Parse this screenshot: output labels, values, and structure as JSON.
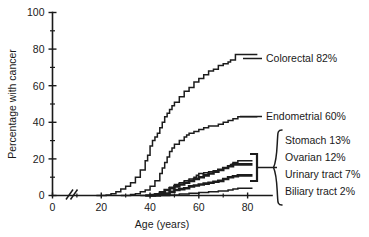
{
  "chart_data": {
    "type": "line",
    "title": "",
    "xlabel": "Age (years)",
    "ylabel": "Percentage with cancer",
    "xlim": [
      0,
      90
    ],
    "ylim": [
      0,
      100
    ],
    "x_ticks": [
      0,
      20,
      40,
      60,
      80
    ],
    "x_ticks_minor": [
      10,
      30,
      50,
      70
    ],
    "y_ticks": [
      0,
      20,
      40,
      60,
      80,
      100
    ],
    "y_ticks_minor": [
      10,
      30,
      50,
      70,
      90
    ],
    "grid": false,
    "legend_position": "right-inline-labels",
    "axis_break": {
      "axis": "x",
      "at": 10,
      "style": "double-slash"
    },
    "series": [
      {
        "name": "Colorectal",
        "label": "Colorectal 82%",
        "lifetime_risk_percent": 82,
        "emphasis": "normal",
        "points": [
          [
            18,
            0
          ],
          [
            22,
            0.3
          ],
          [
            24,
            1
          ],
          [
            26,
            2
          ],
          [
            28,
            3.5
          ],
          [
            30,
            5
          ],
          [
            32,
            7
          ],
          [
            34,
            10
          ],
          [
            36,
            14
          ],
          [
            38,
            19
          ],
          [
            39,
            22
          ],
          [
            40,
            27
          ],
          [
            41,
            30
          ],
          [
            42,
            32
          ],
          [
            43,
            34
          ],
          [
            44,
            37
          ],
          [
            45,
            40
          ],
          [
            46,
            43
          ],
          [
            47,
            45
          ],
          [
            48,
            47
          ],
          [
            49,
            49
          ],
          [
            50,
            51
          ],
          [
            52,
            54
          ],
          [
            54,
            57
          ],
          [
            56,
            59
          ],
          [
            58,
            62
          ],
          [
            60,
            64
          ],
          [
            62,
            66
          ],
          [
            64,
            68
          ],
          [
            66,
            69
          ],
          [
            68,
            71
          ],
          [
            70,
            72
          ],
          [
            72,
            73
          ],
          [
            73,
            74
          ],
          [
            74,
            74
          ],
          [
            75,
            77
          ],
          [
            78,
            77
          ],
          [
            84,
            77
          ]
        ]
      },
      {
        "name": "Endometrial",
        "label": "Endometrial 60%",
        "lifetime_risk_percent": 60,
        "emphasis": "normal",
        "points": [
          [
            28,
            0
          ],
          [
            32,
            0.5
          ],
          [
            34,
            1
          ],
          [
            36,
            2
          ],
          [
            38,
            3
          ],
          [
            40,
            5
          ],
          [
            42,
            8
          ],
          [
            44,
            12
          ],
          [
            45,
            15
          ],
          [
            46,
            18
          ],
          [
            47,
            21
          ],
          [
            48,
            24
          ],
          [
            49,
            26
          ],
          [
            50,
            28
          ],
          [
            52,
            30
          ],
          [
            54,
            32
          ],
          [
            55,
            33
          ],
          [
            56,
            34
          ],
          [
            58,
            35
          ],
          [
            60,
            36
          ],
          [
            62,
            37
          ],
          [
            64,
            38
          ],
          [
            66,
            38
          ],
          [
            68,
            39
          ],
          [
            70,
            40
          ],
          [
            72,
            41
          ],
          [
            74,
            42
          ],
          [
            76,
            43
          ],
          [
            84,
            43
          ]
        ]
      },
      {
        "name": "Stomach",
        "label": "Stomach 13%",
        "lifetime_risk_percent": 13,
        "emphasis": "normal",
        "points": [
          [
            36,
            0
          ],
          [
            40,
            0.5
          ],
          [
            42,
            1
          ],
          [
            44,
            2
          ],
          [
            46,
            3
          ],
          [
            48,
            4.5
          ],
          [
            50,
            6
          ],
          [
            52,
            7
          ],
          [
            54,
            8
          ],
          [
            56,
            9
          ],
          [
            58,
            10
          ],
          [
            59,
            11
          ],
          [
            60,
            12
          ],
          [
            62,
            12.5
          ],
          [
            64,
            13
          ],
          [
            66,
            13.5
          ],
          [
            68,
            14
          ],
          [
            70,
            15
          ],
          [
            72,
            16
          ],
          [
            73,
            17
          ],
          [
            74,
            18
          ],
          [
            76,
            19
          ],
          [
            78,
            19
          ],
          [
            82,
            19
          ]
        ]
      },
      {
        "name": "Ovarian",
        "label": "Ovarian 12%",
        "lifetime_risk_percent": 12,
        "emphasis": "thick",
        "points": [
          [
            38,
            0
          ],
          [
            42,
            0.5
          ],
          [
            44,
            1.5
          ],
          [
            46,
            3
          ],
          [
            48,
            4
          ],
          [
            50,
            5
          ],
          [
            52,
            6
          ],
          [
            54,
            7
          ],
          [
            56,
            8
          ],
          [
            58,
            9
          ],
          [
            60,
            10
          ],
          [
            62,
            11
          ],
          [
            64,
            12
          ],
          [
            66,
            13
          ],
          [
            68,
            14
          ],
          [
            70,
            15
          ],
          [
            72,
            16
          ],
          [
            74,
            17
          ],
          [
            76,
            17
          ],
          [
            82,
            17
          ]
        ]
      },
      {
        "name": "Urinary tract",
        "label": "Urinary tract 7%",
        "lifetime_risk_percent": 7,
        "emphasis": "thick",
        "points": [
          [
            40,
            0
          ],
          [
            44,
            0.5
          ],
          [
            46,
            1
          ],
          [
            48,
            2
          ],
          [
            50,
            3
          ],
          [
            52,
            3.5
          ],
          [
            54,
            4
          ],
          [
            56,
            5
          ],
          [
            58,
            5.5
          ],
          [
            60,
            6
          ],
          [
            62,
            6.5
          ],
          [
            64,
            7
          ],
          [
            66,
            7.5
          ],
          [
            68,
            8
          ],
          [
            70,
            9
          ],
          [
            72,
            10
          ],
          [
            74,
            10.5
          ],
          [
            76,
            11
          ],
          [
            82,
            11
          ]
        ]
      },
      {
        "name": "Biliary tract",
        "label": "Biliary tract 2%",
        "lifetime_risk_percent": 2,
        "emphasis": "normal",
        "points": [
          [
            44,
            0
          ],
          [
            48,
            0.3
          ],
          [
            52,
            0.8
          ],
          [
            56,
            1.2
          ],
          [
            60,
            1.6
          ],
          [
            64,
            2
          ],
          [
            68,
            2.4
          ],
          [
            72,
            3
          ],
          [
            74,
            3.5
          ],
          [
            76,
            4
          ],
          [
            82,
            4
          ]
        ]
      }
    ],
    "annotations": [
      {
        "name": "group-brace",
        "kind": "curly-brace",
        "groups": [
          "Stomach 13%",
          "Ovarian 12%",
          "Urinary tract 7%",
          "Biliary tract 2%"
        ]
      },
      {
        "name": "curve-bracket",
        "kind": "square-bracket",
        "points_to": [
          "Stomach",
          "Ovarian",
          "Urinary tract",
          "Biliary tract"
        ]
      }
    ]
  },
  "axes": {
    "y_label": "Percentage with cancer",
    "x_label": "Age (years)",
    "y_tick_labels": [
      "0",
      "20",
      "40",
      "60",
      "80",
      "100"
    ],
    "x_tick_labels": [
      "0",
      "20",
      "40",
      "60",
      "80"
    ]
  },
  "labels": {
    "colorectal": "Colorectal 82%",
    "endometrial": "Endometrial 60%",
    "stomach": "Stomach 13%",
    "ovarian": "Ovarian 12%",
    "urinary": "Urinary tract 7%",
    "biliary": "Biliary tract 2%"
  },
  "colors": {
    "ink": "#1a1a1a",
    "background": "#ffffff"
  }
}
